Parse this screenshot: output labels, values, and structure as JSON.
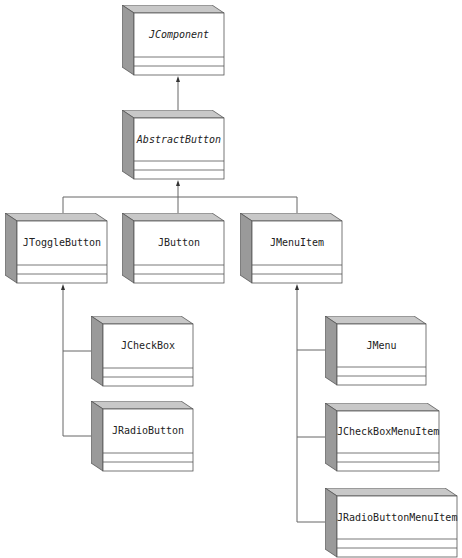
{
  "diagram": {
    "type": "uml-class-hierarchy",
    "colors": {
      "box_front": "#ffffff",
      "box_side": "#9a9a9a",
      "box_top": "#c8c8c8",
      "stroke": "#555555",
      "line": "#666666"
    },
    "classes": [
      {
        "id": "jcomponent",
        "name": "JComponent",
        "abstract": true,
        "x": 122,
        "y": 5,
        "w": 102,
        "h": 70,
        "parent": null
      },
      {
        "id": "abstractbutton",
        "name": "AbstractButton",
        "abstract": true,
        "x": 122,
        "y": 110,
        "w": 102,
        "h": 69,
        "parent": "jcomponent"
      },
      {
        "id": "jtogglebutton",
        "name": "JToggleButton",
        "abstract": false,
        "x": 5,
        "y": 213,
        "w": 102,
        "h": 70,
        "parent": "abstractbutton"
      },
      {
        "id": "jbutton",
        "name": "JButton",
        "abstract": false,
        "x": 122,
        "y": 213,
        "w": 102,
        "h": 70,
        "parent": "abstractbutton"
      },
      {
        "id": "jmenuitem",
        "name": "JMenuItem",
        "abstract": false,
        "x": 240,
        "y": 213,
        "w": 102,
        "h": 70,
        "parent": "abstractbutton"
      },
      {
        "id": "jcheckbox",
        "name": "JCheckBox",
        "abstract": false,
        "x": 91,
        "y": 316,
        "w": 102,
        "h": 70,
        "parent": "jtogglebutton"
      },
      {
        "id": "jradiobutton",
        "name": "JRadioButton",
        "abstract": false,
        "x": 91,
        "y": 401,
        "w": 102,
        "h": 70,
        "parent": "jtogglebutton"
      },
      {
        "id": "jmenu",
        "name": "JMenu",
        "abstract": false,
        "x": 325,
        "y": 316,
        "w": 101,
        "h": 69,
        "parent": "jmenuitem"
      },
      {
        "id": "jcheckboxmenuitem",
        "name": "JCheckBoxMenuItem",
        "abstract": false,
        "x": 325,
        "y": 403,
        "w": 114,
        "h": 68,
        "parent": "jmenuitem"
      },
      {
        "id": "jradiobuttonmenuitem",
        "name": "JRadioButtonMenuItem",
        "abstract": false,
        "x": 325,
        "y": 488,
        "w": 132,
        "h": 69,
        "parent": "jmenuitem"
      }
    ],
    "relationships": [
      {
        "from": "abstractbutton",
        "to": "jcomponent",
        "kind": "generalization"
      },
      {
        "from": "jtogglebutton",
        "to": "abstractbutton",
        "kind": "generalization"
      },
      {
        "from": "jbutton",
        "to": "abstractbutton",
        "kind": "generalization"
      },
      {
        "from": "jmenuitem",
        "to": "abstractbutton",
        "kind": "generalization"
      },
      {
        "from": "jcheckbox",
        "to": "jtogglebutton",
        "kind": "generalization"
      },
      {
        "from": "jradiobutton",
        "to": "jtogglebutton",
        "kind": "generalization"
      },
      {
        "from": "jmenu",
        "to": "jmenuitem",
        "kind": "generalization"
      },
      {
        "from": "jcheckboxmenuitem",
        "to": "jmenuitem",
        "kind": "generalization"
      },
      {
        "from": "jradiobuttonmenuitem",
        "to": "jmenuitem",
        "kind": "generalization"
      }
    ]
  },
  "labels": {
    "jcomponent": "JComponent",
    "abstractbutton": "AbstractButton",
    "jtogglebutton": "JToggleButton",
    "jbutton": "JButton",
    "jmenuitem": "JMenuItem",
    "jcheckbox": "JCheckBox",
    "jradiobutton": "JRadioButton",
    "jmenu": "JMenu",
    "jcheckboxmenuitem": "JCheckBoxMenuItem",
    "jradiobuttonmenuitem": "JRadioButtonMenuItem"
  }
}
